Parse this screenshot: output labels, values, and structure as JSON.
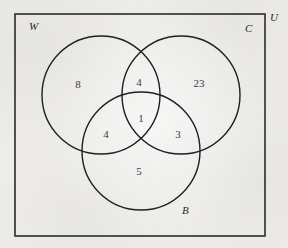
{
  "figure": {
    "kind": "venn-diagram",
    "sets_count": 3,
    "background_color": "#eeedea",
    "stroke_color": "#2b2b2b",
    "text_color": "#3a3a3a",
    "universe": {
      "label": "U",
      "label_name": "universal-set-label",
      "rect": {
        "x": 15,
        "y": 14,
        "width": 250,
        "height": 222
      },
      "label_pos": {
        "x": 270,
        "y": 12
      }
    },
    "circles": [
      {
        "key": "W",
        "label": "W",
        "label_name": "set-label-w",
        "cx": 101,
        "cy": 95,
        "r": 59,
        "label_pos": {
          "x": 29,
          "y": 21
        }
      },
      {
        "key": "C",
        "label": "C",
        "label_name": "set-label-c",
        "cx": 181,
        "cy": 95,
        "r": 59,
        "label_pos": {
          "x": 245,
          "y": 23
        }
      },
      {
        "key": "B",
        "label": "B",
        "label_name": "set-label-b",
        "cx": 141,
        "cy": 151,
        "r": 59,
        "label_pos": {
          "x": 182,
          "y": 205
        }
      }
    ],
    "regions": [
      {
        "id": "w-only",
        "name": "region-count-w-only",
        "sets": "W",
        "value": "8",
        "x": 78,
        "y": 84
      },
      {
        "id": "w-and-c",
        "name": "region-count-w-and-c",
        "sets": "W∩C",
        "value": "4",
        "x": 139,
        "y": 82
      },
      {
        "id": "c-only",
        "name": "region-count-c-only",
        "sets": "C",
        "value": "23",
        "x": 199,
        "y": 83
      },
      {
        "id": "w-and-b",
        "name": "region-count-w-and-b",
        "sets": "W∩B",
        "value": "4",
        "x": 106,
        "y": 134
      },
      {
        "id": "all-three",
        "name": "region-count-all-three",
        "sets": "W∩C∩B",
        "value": "1",
        "x": 141,
        "y": 118
      },
      {
        "id": "c-and-b",
        "name": "region-count-c-and-b",
        "sets": "C∩B",
        "value": "3",
        "x": 178,
        "y": 134
      },
      {
        "id": "b-only",
        "name": "region-count-b-only",
        "sets": "B",
        "value": "5",
        "x": 139,
        "y": 171
      }
    ]
  },
  "chart_data": {
    "type": "venn",
    "title": "",
    "sets": [
      "W",
      "C",
      "B"
    ],
    "universe_label": "U",
    "region_labels": [
      "W only",
      "W and C only",
      "C only",
      "W and B only",
      "W and C and B",
      "C and B only",
      "B only"
    ],
    "region_keys": [
      "W",
      "WC",
      "C",
      "WB",
      "WCB",
      "CB",
      "B"
    ],
    "values": [
      8,
      4,
      23,
      4,
      1,
      3,
      5
    ],
    "set_totals": {
      "W": 17,
      "C": 31,
      "B": 13
    },
    "total_inside_circles": 48,
    "outside_value": null,
    "grid": false,
    "legend": "none"
  }
}
